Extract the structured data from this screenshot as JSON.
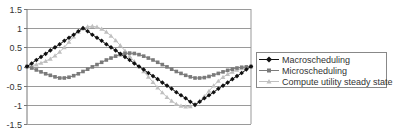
{
  "chart_data": {
    "type": "line",
    "title": "",
    "xlabel": "",
    "ylabel": "",
    "ylim": [
      -1.5,
      1.5
    ],
    "yticks": [
      "1.5",
      "1",
      "0.5",
      "0",
      "-0.5",
      "-1",
      "-1.5"
    ],
    "ytick_values": [
      1.5,
      1,
      0.5,
      0,
      -0.5,
      -1,
      -1.5
    ],
    "grid": true,
    "legend_position": "right",
    "x_points": 49,
    "series": [
      {
        "name": "Macroscheduling",
        "color": "#111111",
        "marker": "diamond",
        "values": [
          0,
          0.08,
          0.17,
          0.25,
          0.33,
          0.42,
          0.5,
          0.58,
          0.67,
          0.75,
          0.83,
          0.92,
          1,
          0.92,
          0.83,
          0.75,
          0.67,
          0.58,
          0.5,
          0.42,
          0.33,
          0.25,
          0.17,
          0.08,
          0,
          -0.08,
          -0.17,
          -0.25,
          -0.33,
          -0.42,
          -0.5,
          -0.58,
          -0.67,
          -0.75,
          -0.83,
          -0.92,
          -1,
          -0.92,
          -0.83,
          -0.75,
          -0.67,
          -0.58,
          -0.5,
          -0.42,
          -0.33,
          -0.25,
          -0.17,
          -0.08,
          0
        ]
      },
      {
        "name": "Microscheduling",
        "color": "#7a7a7a",
        "marker": "square",
        "values": [
          0,
          -0.04,
          -0.09,
          -0.14,
          -0.19,
          -0.23,
          -0.27,
          -0.3,
          -0.3,
          -0.28,
          -0.24,
          -0.19,
          -0.13,
          -0.07,
          -0.01,
          0.05,
          0.11,
          0.17,
          0.22,
          0.27,
          0.31,
          0.34,
          0.35,
          0.34,
          0.31,
          0.27,
          0.22,
          0.17,
          0.11,
          0.05,
          -0.01,
          -0.07,
          -0.13,
          -0.18,
          -0.23,
          -0.27,
          -0.3,
          -0.3,
          -0.29,
          -0.26,
          -0.22,
          -0.18,
          -0.14,
          -0.1,
          -0.07,
          -0.04,
          -0.02,
          -0.01,
          0
        ]
      },
      {
        "name": "Compute utility steady state",
        "color": "#c0c0c0",
        "marker": "triangle",
        "values": [
          0,
          0.02,
          0.05,
          0.09,
          0.14,
          0.2,
          0.28,
          0.38,
          0.5,
          0.64,
          0.78,
          0.9,
          0.99,
          1.04,
          1.05,
          1.03,
          0.98,
          0.9,
          0.8,
          0.68,
          0.55,
          0.41,
          0.27,
          0.13,
          0,
          -0.13,
          -0.27,
          -0.41,
          -0.55,
          -0.68,
          -0.8,
          -0.9,
          -0.98,
          -1.03,
          -1.05,
          -1.04,
          -0.99,
          -0.9,
          -0.78,
          -0.64,
          -0.5,
          -0.38,
          -0.28,
          -0.2,
          -0.14,
          -0.09,
          -0.05,
          -0.02,
          0
        ]
      }
    ]
  },
  "legend": {
    "items": [
      {
        "label": "Macroscheduling"
      },
      {
        "label": "Microscheduling"
      },
      {
        "label": "Compute utility steady state"
      }
    ]
  }
}
